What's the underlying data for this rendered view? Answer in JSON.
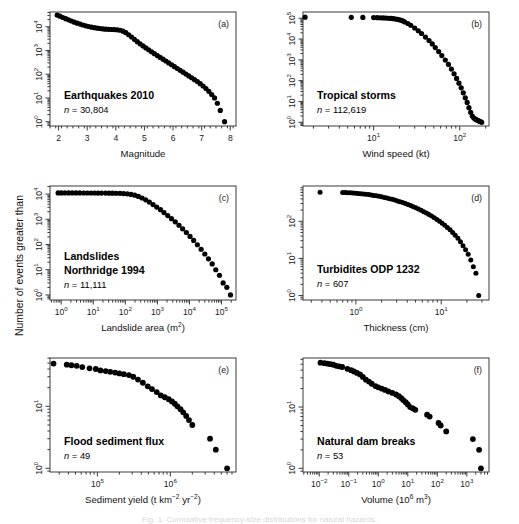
{
  "figure": {
    "shared_ylabel": "Number of events greater than",
    "background": "#ffffff",
    "point_color": "#000000",
    "axis_color": "#3a3a3a",
    "caption_cutoff": "Fig. 1. Cumulative frequency-size distributions for natural hazards."
  },
  "panels": [
    {
      "letter": "(a)",
      "title": "Earthquakes 2010",
      "n_label": "n = 30,804",
      "xlabel": "Magnitude",
      "xlabel_parts": [
        {
          "t": "Magnitude",
          "sup": false
        }
      ],
      "xticks": [
        "2",
        "3",
        "4",
        "5",
        "6",
        "7",
        "8"
      ],
      "xtick_values": [
        2,
        3,
        4,
        5,
        6,
        7,
        8
      ],
      "x_log": false,
      "xlim": [
        1.7,
        8.2
      ],
      "yticks_exp": [
        0,
        1,
        2,
        3,
        4
      ],
      "ylim_exp": [
        -0.18,
        4.62
      ]
    },
    {
      "letter": "(b)",
      "title": "Tropical storms",
      "n_label": "n = 112,619",
      "xlabel": "Wind speed (kt)",
      "xlabel_parts": [
        {
          "t": "Wind speed (kt)",
          "sup": false
        }
      ],
      "xticks_exp": [
        1,
        2
      ],
      "x_log": true,
      "xlim_exp": [
        0.18,
        2.34
      ],
      "yticks_exp": [
        0,
        1,
        2,
        3,
        4,
        5
      ],
      "ylim_exp": [
        -0.18,
        5.3
      ]
    },
    {
      "letter": "(c)",
      "title_lines": [
        "Landslides",
        "Northridge 1994"
      ],
      "n_label": "n = 11,111",
      "xlabel_parts": [
        {
          "t": "Landslide area (m",
          "sup": false
        },
        {
          "t": "2",
          "sup": true
        },
        {
          "t": ")",
          "sup": false
        }
      ],
      "xticks_exp": [
        0,
        1,
        2,
        3,
        4,
        5
      ],
      "x_log": true,
      "xlim_exp": [
        -0.35,
        5.45
      ],
      "yticks_exp": [
        0,
        1,
        2,
        3,
        4
      ],
      "ylim_exp": [
        -0.2,
        4.32
      ]
    },
    {
      "letter": "(d)",
      "title": "Turbidites ODP 1232",
      "n_label": "n = 607",
      "xlabel": "Thickness (cm)",
      "xlabel_parts": [
        {
          "t": "Thickness (cm)",
          "sup": false
        }
      ],
      "xticks_exp": [
        0,
        1
      ],
      "x_log": true,
      "xlim_exp": [
        -0.62,
        1.56
      ],
      "yticks_exp": [
        0,
        1,
        2
      ],
      "ylim_exp": [
        -0.12,
        2.95
      ]
    },
    {
      "letter": "(e)",
      "title": "Flood sediment flux",
      "n_label": "n = 49",
      "xlabel_parts": [
        {
          "t": "Sediment yield (t km",
          "sup": false
        },
        {
          "t": "-2",
          "sup": true
        },
        {
          "t": " yr",
          "sup": false
        },
        {
          "t": "-2",
          "sup": true
        },
        {
          "t": ")",
          "sup": false
        }
      ],
      "xticks_exp": [
        5,
        6
      ],
      "x_log": true,
      "xlim_exp": [
        4.35,
        6.9
      ],
      "yticks_exp": [
        0,
        1
      ],
      "ylim_exp": [
        -0.06,
        1.78
      ]
    },
    {
      "letter": "(f)",
      "title": "Natural dam breaks",
      "n_label": "n = 53",
      "xlabel_parts": [
        {
          "t": "Volume (10",
          "sup": false
        },
        {
          "t": "6",
          "sup": true
        },
        {
          "t": " m",
          "sup": false
        },
        {
          "t": "3",
          "sup": true
        },
        {
          "t": ")",
          "sup": false
        }
      ],
      "xticks_exp": [
        -2,
        -1,
        0,
        1,
        2,
        3
      ],
      "x_log": true,
      "xlim_exp": [
        -2.55,
        3.75
      ],
      "yticks_exp": [
        0,
        1
      ],
      "ylim_exp": [
        -0.06,
        1.8
      ]
    }
  ],
  "chart_data": [
    {
      "type": "scatter",
      "panel": "a",
      "title": "Earthquakes 2010",
      "xlabel": "Magnitude",
      "ylabel": "Number of events greater than",
      "n": 30804,
      "xlim": [
        1.7,
        8.2
      ],
      "ylim": [
        1,
        41687
      ],
      "x_scale": "linear",
      "y_scale": "log",
      "note": "Cumulative frequency-magnitude distribution; Gutenberg-Richter roll-off",
      "x": [
        1.95,
        2.05,
        2.15,
        2.25,
        2.35,
        2.45,
        2.55,
        2.65,
        2.75,
        2.85,
        2.95,
        3.05,
        3.15,
        3.25,
        3.35,
        3.45,
        3.55,
        3.65,
        3.75,
        3.85,
        3.95,
        4.05,
        4.15,
        4.25,
        4.35,
        4.45,
        4.55,
        4.65,
        4.75,
        4.85,
        4.95,
        5.05,
        5.15,
        5.25,
        5.35,
        5.45,
        5.55,
        5.65,
        5.75,
        5.85,
        5.95,
        6.05,
        6.15,
        6.25,
        6.35,
        6.45,
        6.55,
        6.65,
        6.75,
        6.85,
        6.95,
        7.05,
        7.15,
        7.25,
        7.35,
        7.45,
        7.55,
        7.65,
        7.8
      ],
      "y": [
        30804,
        27800,
        24500,
        21800,
        19500,
        17400,
        15600,
        14100,
        12900,
        11800,
        10900,
        10200,
        9600,
        9100,
        8700,
        8400,
        8100,
        7900,
        7750,
        7650,
        7550,
        7400,
        7100,
        6500,
        5600,
        4600,
        3700,
        2950,
        2350,
        1900,
        1550,
        1280,
        1060,
        880,
        730,
        610,
        510,
        430,
        360,
        300,
        250,
        208,
        174,
        146,
        122,
        102,
        85,
        71,
        59,
        49,
        40,
        32,
        25,
        19,
        14,
        10,
        6,
        3,
        1
      ]
    },
    {
      "type": "scatter",
      "panel": "b",
      "title": "Tropical storms",
      "xlabel": "Wind speed (kt)",
      "ylabel": "Number of events greater than",
      "n": 112619,
      "xlim": [
        1.5,
        220
      ],
      "ylim": [
        1,
        130000
      ],
      "x_scale": "log",
      "y_scale": "log",
      "x": [
        1.6,
        5.5,
        7.5,
        10,
        11,
        12,
        13,
        14,
        15,
        16,
        17,
        18,
        19,
        20,
        21,
        22,
        23,
        25,
        27,
        30,
        33,
        36,
        40,
        44,
        48,
        52,
        57,
        62,
        68,
        74,
        80,
        86,
        92,
        98,
        104,
        110,
        116,
        122,
        128,
        134,
        140,
        146,
        152,
        158,
        164,
        170,
        176,
        180
      ],
      "y": [
        112619,
        111000,
        110000,
        108000,
        106500,
        105000,
        103500,
        102000,
        100000,
        98000,
        95000,
        92000,
        88000,
        84000,
        79000,
        73000,
        66000,
        56000,
        46000,
        34000,
        25000,
        18500,
        12500,
        8500,
        5800,
        3900,
        2500,
        1600,
        980,
        600,
        360,
        215,
        128,
        76,
        45,
        26,
        15,
        9,
        5,
        3,
        2,
        1.6,
        1.4,
        1.3,
        1.2,
        1.1,
        1.05,
        1
      ]
    },
    {
      "type": "scatter",
      "panel": "c",
      "title": "Landslides Northridge 1994",
      "xlabel": "Landslide area (m2)",
      "ylabel": "Number of events greater than",
      "n": 11111,
      "xlim": [
        0.45,
        280000
      ],
      "ylim": [
        1,
        21000
      ],
      "x_scale": "log",
      "y_scale": "log",
      "x": [
        0.8,
        1,
        1.3,
        1.7,
        2.2,
        2.9,
        3.8,
        5,
        6.5,
        8.5,
        11,
        14,
        18,
        24,
        31,
        40,
        52,
        68,
        88,
        115,
        150,
        195,
        255,
        330,
        430,
        560,
        730,
        950,
        1250,
        1600,
        2100,
        2750,
        3600,
        4700,
        6100,
        8000,
        10400,
        13500,
        17600,
        23000,
        30000,
        39000,
        51000,
        66000,
        86000,
        112000,
        146000,
        190000
      ],
      "y": [
        11111,
        11111,
        11100,
        11090,
        11080,
        11070,
        11060,
        11050,
        11040,
        11030,
        11020,
        11000,
        10980,
        10950,
        10900,
        10850,
        10800,
        10700,
        10500,
        10200,
        9700,
        9000,
        8100,
        7000,
        5900,
        4800,
        3850,
        3050,
        2400,
        1850,
        1400,
        1060,
        790,
        580,
        420,
        300,
        210,
        145,
        98,
        65,
        42,
        27,
        17,
        10,
        6,
        3,
        2,
        1
      ]
    },
    {
      "type": "scatter",
      "panel": "d",
      "title": "Turbidites ODP 1232",
      "xlabel": "Thickness (cm)",
      "ylabel": "Number of events greater than",
      "n": 607,
      "xlim": [
        0.25,
        36
      ],
      "ylim": [
        1,
        760
      ],
      "x_scale": "log",
      "y_scale": "log",
      "x": [
        0.38,
        0.7,
        0.75,
        0.8,
        0.86,
        0.92,
        0.99,
        1.06,
        1.14,
        1.22,
        1.31,
        1.41,
        1.51,
        1.62,
        1.74,
        1.87,
        2.0,
        2.15,
        2.31,
        2.48,
        2.66,
        2.86,
        3.07,
        3.29,
        3.54,
        3.8,
        4.08,
        4.38,
        4.7,
        5.04,
        5.41,
        5.81,
        6.24,
        6.7,
        7.19,
        7.72,
        8.29,
        8.9,
        9.55,
        10.25,
        11,
        11.8,
        12.7,
        13.6,
        14.6,
        15.7,
        16.8,
        18.0,
        19.3,
        20.7,
        22.2,
        23.8,
        25.5,
        27.5
      ],
      "y": [
        607,
        600,
        596,
        590,
        584,
        577,
        570,
        562,
        553,
        544,
        534,
        523,
        511,
        498,
        485,
        471,
        456,
        440,
        424,
        407,
        390,
        372,
        354,
        336,
        318,
        300,
        282,
        264,
        247,
        230,
        213,
        197,
        181,
        166,
        152,
        138,
        125,
        112,
        100,
        89,
        78,
        68,
        59,
        50,
        42,
        35,
        28,
        22,
        17,
        13,
        9,
        6,
        4,
        1
      ]
    },
    {
      "type": "scatter",
      "panel": "e",
      "title": "Flood sediment flux",
      "xlabel": "Sediment yield (t km-2 yr-2)",
      "ylabel": "Number of events greater than",
      "n": 49,
      "xlim": [
        22000,
        8000000
      ],
      "ylim": [
        1,
        60
      ],
      "x_scale": "log",
      "y_scale": "log",
      "x": [
        25000,
        38000,
        44000,
        52000,
        62000,
        78000,
        95000,
        110000,
        130000,
        150000,
        175000,
        200000,
        230000,
        270000,
        310000,
        360000,
        420000,
        490000,
        560000,
        650000,
        740000,
        840000,
        950000,
        1050000,
        1150000,
        1250000,
        1380000,
        1500000,
        1650000,
        1800000,
        2000000,
        3500000,
        4200000,
        6000000
      ],
      "y": [
        49,
        47,
        46,
        45,
        43,
        41,
        40,
        38,
        37,
        36,
        35,
        34,
        33,
        32,
        30,
        27,
        24,
        21,
        19,
        17,
        15,
        14,
        13,
        12,
        11,
        10,
        9,
        8,
        7,
        6,
        5,
        3,
        2,
        1
      ]
    },
    {
      "type": "scatter",
      "panel": "f",
      "title": "Natural dam breaks",
      "xlabel": "Volume (106 m3)",
      "ylabel": "Number of events greater than",
      "n": 53,
      "xlim": [
        0.0035,
        5600
      ],
      "ylim": [
        1,
        65
      ],
      "x_scale": "log",
      "y_scale": "log",
      "x": [
        0.011,
        0.015,
        0.019,
        0.024,
        0.03,
        0.038,
        0.048,
        0.06,
        0.09,
        0.12,
        0.15,
        0.19,
        0.24,
        0.3,
        0.38,
        0.48,
        0.6,
        0.8,
        1.0,
        1.3,
        1.7,
        2.2,
        3.0,
        4.0,
        5.0,
        6.0,
        7.0,
        8.5,
        10,
        12,
        15,
        18,
        45,
        55,
        110,
        130,
        200,
        1600,
        2600,
        3000
      ],
      "y": [
        53,
        52,
        51,
        50,
        49,
        47,
        46,
        45,
        42,
        40,
        38,
        36,
        34,
        31,
        28,
        26,
        24,
        22,
        21,
        20,
        19,
        18,
        17,
        16,
        15,
        14,
        13,
        12,
        11,
        10,
        9.5,
        9,
        7.5,
        7,
        5.5,
        5,
        4,
        3,
        2,
        1
      ]
    }
  ]
}
